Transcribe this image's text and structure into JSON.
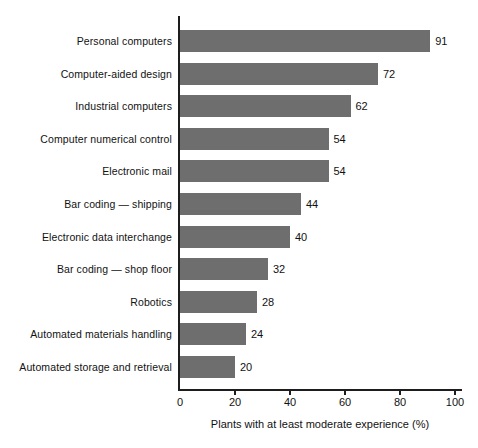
{
  "chart_data": {
    "type": "bar",
    "orientation": "horizontal",
    "title": "",
    "subtitle": "",
    "xlabel": "Plants with at least moderate experience (%)",
    "ylabel": "",
    "xlim": [
      0,
      100
    ],
    "xticks": [
      0,
      20,
      40,
      60,
      80,
      100
    ],
    "grid": false,
    "legend": null,
    "bar_color": "#6e6e6e",
    "axis_color": "#1d1d1d",
    "background": "#ffffff",
    "data_labels": true,
    "categories": [
      "Personal computers",
      "Computer-aided design",
      "Industrial computers",
      "Computer numerical control",
      "Electronic mail",
      "Bar coding — shipping",
      "Electronic data interchange",
      "Bar coding — shop floor",
      "Robotics",
      "Automated materials handling",
      "Automated storage and retrieval"
    ],
    "values": [
      91,
      72,
      62,
      54,
      54,
      44,
      40,
      32,
      28,
      24,
      20
    ],
    "value_labels": [
      "91",
      "72",
      "62",
      "54",
      "54",
      "44",
      "40",
      "32",
      "28",
      "24",
      "20"
    ],
    "xtick_labels": [
      "0",
      "20",
      "40",
      "60",
      "80",
      "100"
    ]
  }
}
